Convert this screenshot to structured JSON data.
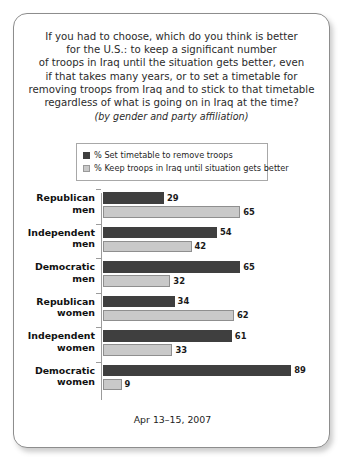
{
  "card": {
    "title_lines": [
      "If you had to choose, which do you think is better",
      "for the U.S.: to keep a significant number",
      "of troops in Iraq until the situation gets better, even",
      "if that takes many years, or to set a timetable for",
      "removing troops from Iraq and to stick to that timetable",
      "regardless of what is going on in Iraq at the time?"
    ],
    "subtitle": "(by gender and party affiliation)",
    "footer": "Apr 13–15, 2007"
  },
  "colors": {
    "series_dark": "#3f3f3f",
    "series_light": "#c9c9c9",
    "border": "#8d8d8d",
    "axis": "#9b9b9b"
  },
  "chart_data": {
    "type": "bar",
    "orientation": "horizontal",
    "subtitle": "(by gender and party affiliation)",
    "xlabel": "",
    "ylabel": "",
    "xlim": [
      0,
      100
    ],
    "grid": false,
    "legend_position": "top",
    "categories": [
      "Republican men",
      "Independent men",
      "Democratic men",
      "Republican women",
      "Independent women",
      "Democratic women"
    ],
    "category_lines": [
      [
        "Republican",
        "men"
      ],
      [
        "Independent",
        "men"
      ],
      [
        "Democratic",
        "men"
      ],
      [
        "Republican",
        "women"
      ],
      [
        "Independent",
        "women"
      ],
      [
        "Democratic",
        "women"
      ]
    ],
    "series": [
      {
        "name": "% Set timetable to remove troops",
        "color": "#3f3f3f",
        "values": [
          29,
          54,
          65,
          34,
          61,
          89
        ]
      },
      {
        "name": "% Keep troops in Iraq until situation gets better",
        "color": "#c9c9c9",
        "values": [
          65,
          42,
          32,
          62,
          33,
          9
        ]
      }
    ]
  }
}
